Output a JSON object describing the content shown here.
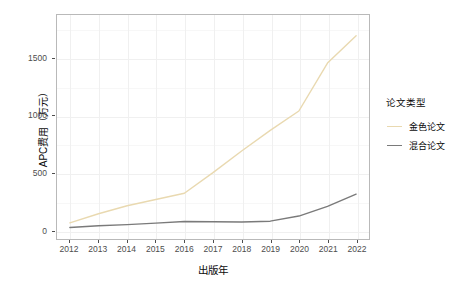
{
  "chart_data": {
    "type": "line",
    "title": "",
    "xlabel": "出版年",
    "ylabel": "APC费用（万元）",
    "x": [
      2012,
      2013,
      2014,
      2015,
      2016,
      2017,
      2018,
      2019,
      2020,
      2021,
      2022
    ],
    "categories": [
      "2012",
      "2013",
      "2014",
      "2015",
      "2016",
      "2017",
      "2018",
      "2019",
      "2020",
      "2021",
      "2022"
    ],
    "series": [
      {
        "name": "金色论文",
        "color": "#e9d9b0",
        "values": [
          60,
          140,
          210,
          265,
          320,
          500,
          690,
          870,
          1040,
          1460,
          1700
        ]
      },
      {
        "name": "混合论文",
        "color": "#7a7a7a",
        "values": [
          20,
          35,
          45,
          58,
          72,
          70,
          68,
          75,
          120,
          205,
          312
        ]
      }
    ],
    "xlim": [
      2012,
      2022
    ],
    "ylim": [
      0,
      1800
    ],
    "yticks": [
      0,
      500,
      1000,
      1500
    ],
    "ytick_labels": [
      "0",
      "500",
      "1000",
      "1500"
    ],
    "xticks": [
      2012,
      2013,
      2014,
      2015,
      2016,
      2017,
      2018,
      2019,
      2020,
      2021,
      2022
    ],
    "grid": true,
    "legend_position": "right",
    "legend_title": "论文类型"
  },
  "legend": {
    "title": "论文类型",
    "items": [
      {
        "label": "金色论文",
        "color": "#e9d9b0"
      },
      {
        "label": "混合论文",
        "color": "#7a7a7a"
      }
    ]
  },
  "axes": {
    "x_title": "出版年",
    "y_title": "APC费用（万元）",
    "y_ticks": [
      "1500",
      "1000",
      "500",
      "0"
    ],
    "x_ticks": [
      "2012",
      "2013",
      "2014",
      "2015",
      "2016",
      "2017",
      "2018",
      "2019",
      "2020",
      "2021",
      "2022"
    ]
  },
  "style": {
    "panel_border": "#b9b9b9",
    "grid_major": "#f0f0f0",
    "grid_minor": "#f7f7f7",
    "background": "#ffffff",
    "text": "#0a0a0a",
    "tick_text": "#4d4d4d"
  }
}
